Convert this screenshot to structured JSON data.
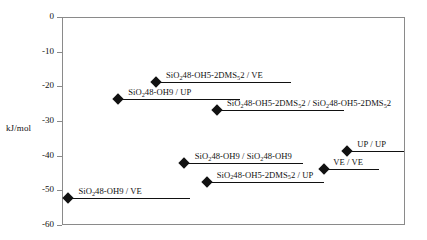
{
  "chart_data": {
    "type": "line",
    "title": "",
    "xlabel": "",
    "ylabel": "kJ/mol",
    "ylim": [
      -60,
      0
    ],
    "yticks": [
      "0",
      "-10",
      "-20",
      "-30",
      "-40",
      "-50",
      "-60"
    ],
    "ytick_values": [
      0,
      -10,
      -20,
      -30,
      -40,
      -50,
      -60
    ],
    "grid": false,
    "legend": "none",
    "series": [
      {
        "name": "SiO248-OH5-2DMS52 / VE",
        "label_html": "SiO<sub>2</sub>48-OH5-2DMS<sub>5</sub>2 / VE",
        "value": -18.5,
        "x_start_pct": 27.1,
        "x_end_pct": 66.5,
        "label_left_pct": 30.0,
        "label_offset_y": -11
      },
      {
        "name": "SiO248-OH9 / UP",
        "label_html": "SiO<sub>2</sub>48-OH9 / UP",
        "value": -23.4,
        "x_start_pct": 16.0,
        "x_end_pct": 51.6,
        "label_left_pct": 19.0,
        "label_offset_y": -11
      },
      {
        "name": "SiO248-OH5-2DMS52 / SiO248-OH5-2DMS52",
        "label_html": "SiO<sub>2</sub>48-OH5-2DMS<sub>5</sub>2 / SiO<sub>2</sub>48-OH5-2DMS<sub>5</sub>2",
        "value": -26.6,
        "x_start_pct": 45.0,
        "x_end_pct": 82.0,
        "label_left_pct": 47.8,
        "label_offset_y": -11
      },
      {
        "name": "UP / UP",
        "label_html": "UP / UP",
        "value": -38.5,
        "x_start_pct": 82.8,
        "x_end_pct": 99.5,
        "label_left_pct": 85.8,
        "label_offset_y": -11
      },
      {
        "name": "SiO248-OH9 / SiO248-OH9",
        "label_html": "SiO<sub>2</sub>48-OH9 / SiO<sub>2</sub>48-OH9",
        "value": -41.9,
        "x_start_pct": 35.4,
        "x_end_pct": 70.0,
        "label_left_pct": 38.4,
        "label_offset_y": -11
      },
      {
        "name": "VE / VE",
        "label_html": "VE / VE",
        "value": -43.6,
        "x_start_pct": 76.2,
        "x_end_pct": 92.0,
        "label_left_pct": 78.8,
        "label_offset_y": -11
      },
      {
        "name": "SiO248-OH5-2DMS52 / UP",
        "label_html": "SiO<sub>2</sub>48-OH5-2DMS<sub>5</sub>2 / UP",
        "value": -47.2,
        "x_start_pct": 42.0,
        "x_end_pct": 76.0,
        "label_left_pct": 44.8,
        "label_offset_y": -11
      },
      {
        "name": "SiO248-OH9 / VE",
        "label_html": "SiO<sub>2</sub>48-OH9 / VE",
        "value": -52.0,
        "x_start_pct": 1.5,
        "x_end_pct": 37.0,
        "label_left_pct": 4.5,
        "label_offset_y": -11
      }
    ],
    "colors": {
      "marker": "#111111",
      "line": "#111111",
      "frame": "#8a8a8a",
      "background": "#ffffff",
      "text": "#111111"
    }
  }
}
